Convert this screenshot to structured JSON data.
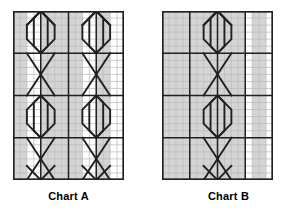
{
  "figure": {
    "background": "#ffffff",
    "stroke_color": "#231f20",
    "grid_light_color": "#b8b8b8",
    "shade_color": "#d4d4d4",
    "width": 297,
    "height": 213
  },
  "charts": [
    {
      "id": "chart-a",
      "label": "Chart A",
      "frame": {
        "x": 13,
        "y": 11,
        "w": 111,
        "h": 169
      },
      "grid": {
        "cols": 16,
        "rows": 24
      },
      "shaded_columns": [
        0,
        1,
        4,
        5,
        6,
        7,
        8,
        9,
        12,
        13
      ],
      "heavy_rows": [
        0,
        6,
        12,
        18,
        24
      ],
      "heavy_cols": [
        0,
        4,
        8,
        12,
        16
      ],
      "motifs": "two-column braided cable: stacked hexagons with crossing diagonals"
    },
    {
      "id": "chart-b",
      "label": "Chart B",
      "frame": {
        "x": 162,
        "y": 11,
        "w": 111,
        "h": 169
      },
      "grid": {
        "cols": 16,
        "rows": 24
      },
      "shaded_columns": [
        0,
        1,
        2,
        3,
        4,
        5,
        6,
        7,
        8,
        9,
        10,
        11,
        13,
        14
      ],
      "heavy_rows": [
        0,
        6,
        12,
        18,
        24
      ],
      "heavy_cols": [
        0,
        4,
        8,
        12,
        16
      ],
      "motifs": "single-column braided cable: stacked hexagons with crossing diagonals"
    }
  ],
  "chart_data": {
    "type": "table",
    "title": "",
    "subtitle": "",
    "xlabel": "",
    "ylabel": "",
    "charts": [
      {
        "name": "Chart A",
        "grid_columns": 16,
        "grid_rows": 24,
        "shaded_column_indices": [
          0,
          1,
          4,
          5,
          6,
          7,
          8,
          9,
          12,
          13
        ],
        "heavy_row_indices": [
          0,
          6,
          12,
          18,
          24
        ],
        "heavy_column_indices": [
          0,
          4,
          8,
          12,
          16
        ],
        "cable_centers_x": [
          4,
          8,
          12
        ],
        "repeat_rows": 12,
        "cable_count": 2
      },
      {
        "name": "Chart B",
        "grid_columns": 16,
        "grid_rows": 24,
        "shaded_column_indices": [
          0,
          1,
          2,
          3,
          4,
          5,
          6,
          7,
          8,
          9,
          10,
          11,
          13,
          14
        ],
        "heavy_row_indices": [
          0,
          6,
          12,
          18,
          24
        ],
        "heavy_column_indices": [
          0,
          4,
          8,
          12,
          16
        ],
        "cable_centers_x": [
          8
        ],
        "repeat_rows": 12,
        "cable_count": 1
      }
    ]
  }
}
